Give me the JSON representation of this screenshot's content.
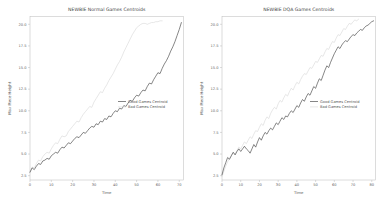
{
  "figure": {
    "background": "#ffffff",
    "width": 383,
    "height": 207
  },
  "chart_data": [
    {
      "type": "line",
      "panel": "left",
      "title": "NEWBIE Normal Games Centroids",
      "xlabel": "Time",
      "ylabel": "Max Piece Height",
      "xlim": [
        0,
        72
      ],
      "ylim": [
        2.0,
        20.9
      ],
      "xticks": [
        0,
        10,
        20,
        30,
        40,
        50,
        60,
        70
      ],
      "yticks": [
        2.5,
        5.0,
        7.5,
        10.0,
        12.5,
        15.0,
        17.5,
        20.0
      ],
      "grid": false,
      "legend_position": "center-right",
      "series": [
        {
          "name": "Good Games Centroid",
          "color": "#3a3a3a",
          "x": [
            0,
            1,
            2,
            3,
            4,
            5,
            6,
            7,
            8,
            9,
            10,
            11,
            12,
            13,
            14,
            15,
            16,
            17,
            18,
            19,
            20,
            21,
            22,
            23,
            24,
            25,
            26,
            27,
            28,
            29,
            30,
            31,
            32,
            33,
            34,
            35,
            36,
            37,
            38,
            39,
            40,
            41,
            42,
            43,
            44,
            45,
            46,
            47,
            48,
            49,
            50,
            51,
            52,
            53,
            54,
            55,
            56,
            57,
            58,
            59,
            60,
            61,
            62,
            63,
            64,
            65,
            66,
            67,
            68,
            69,
            70,
            71
          ],
          "y": [
            2.9,
            3.4,
            3.2,
            3.6,
            3.9,
            3.8,
            4.2,
            4.3,
            4.5,
            4.4,
            4.8,
            5.0,
            5.2,
            5.1,
            5.5,
            5.8,
            5.7,
            6.0,
            6.3,
            6.2,
            6.5,
            6.8,
            7.0,
            6.9,
            7.2,
            7.5,
            7.4,
            7.7,
            8.0,
            8.2,
            8.1,
            8.5,
            8.4,
            8.8,
            8.7,
            9.1,
            9.0,
            9.4,
            9.3,
            9.7,
            10.0,
            9.9,
            10.3,
            10.2,
            10.6,
            10.5,
            10.9,
            11.2,
            11.1,
            11.5,
            11.8,
            11.7,
            12.1,
            12.4,
            12.3,
            12.8,
            13.2,
            13.1,
            13.6,
            14.0,
            14.4,
            14.3,
            14.9,
            15.4,
            15.8,
            16.3,
            16.9,
            17.4,
            18.0,
            18.7,
            19.4,
            20.2
          ]
        },
        {
          "name": "Bad Games Centroid",
          "color": "#d8d8d8",
          "x": [
            0,
            1,
            2,
            3,
            4,
            5,
            6,
            7,
            8,
            9,
            10,
            11,
            12,
            13,
            14,
            15,
            16,
            17,
            18,
            19,
            20,
            21,
            22,
            23,
            24,
            25,
            26,
            27,
            28,
            29,
            30,
            31,
            32,
            33,
            34,
            35,
            36,
            37,
            38,
            39,
            40,
            41,
            42,
            43,
            44,
            45,
            46,
            47,
            48,
            49,
            50,
            51,
            52,
            53,
            54,
            55,
            56,
            57,
            58,
            59,
            60,
            61,
            62
          ],
          "y": [
            2.9,
            3.5,
            3.4,
            3.9,
            4.3,
            4.2,
            4.7,
            5.0,
            5.2,
            5.1,
            5.6,
            6.0,
            6.3,
            6.2,
            6.7,
            7.1,
            7.0,
            7.1,
            7.6,
            7.9,
            8.2,
            8.5,
            8.8,
            8.7,
            9.2,
            9.6,
            9.9,
            10.2,
            10.5,
            10.4,
            11.0,
            11.4,
            11.8,
            12.2,
            12.1,
            12.6,
            13.0,
            13.5,
            13.9,
            14.3,
            14.8,
            15.3,
            15.7,
            16.2,
            16.8,
            17.3,
            17.8,
            18.3,
            18.8,
            19.2,
            19.6,
            19.8,
            20.0,
            20.1,
            20.1,
            20.0,
            20.1,
            20.2,
            20.2,
            20.3,
            20.3,
            20.4,
            20.4
          ]
        }
      ]
    },
    {
      "type": "line",
      "panel": "right",
      "title": "NEWBIE DQA Games Centroids",
      "xlabel": "Time",
      "ylabel": "Max Piece Height",
      "xlim": [
        0,
        82
      ],
      "ylim": [
        2.0,
        20.9
      ],
      "xticks": [
        0,
        10,
        20,
        30,
        40,
        50,
        60,
        70,
        80
      ],
      "yticks": [
        2.5,
        5.0,
        7.5,
        10.0,
        12.5,
        15.0,
        17.5,
        20.0
      ],
      "grid": false,
      "legend_position": "center-right",
      "series": [
        {
          "name": "Good Games Centroid",
          "color": "#3a3a3a",
          "x": [
            0,
            1,
            2,
            3,
            4,
            5,
            6,
            7,
            8,
            9,
            10,
            11,
            12,
            13,
            14,
            15,
            16,
            17,
            18,
            19,
            20,
            21,
            22,
            23,
            24,
            25,
            26,
            27,
            28,
            29,
            30,
            31,
            32,
            33,
            34,
            35,
            36,
            37,
            38,
            39,
            40,
            41,
            42,
            43,
            44,
            45,
            46,
            47,
            48,
            49,
            50,
            51,
            52,
            53,
            54,
            55,
            56,
            57,
            58,
            59,
            60,
            61,
            62,
            63,
            64,
            65,
            66,
            67,
            68,
            69,
            70,
            71,
            72,
            73,
            74,
            75,
            76,
            77,
            78,
            79,
            80,
            81
          ],
          "y": [
            2.6,
            3.4,
            4.0,
            4.6,
            4.4,
            4.8,
            5.2,
            4.9,
            5.3,
            5.6,
            5.3,
            5.6,
            5.9,
            5.6,
            5.4,
            5.1,
            5.6,
            6.1,
            5.8,
            6.4,
            6.9,
            6.6,
            7.1,
            7.5,
            7.3,
            7.7,
            8.0,
            7.8,
            8.2,
            8.6,
            8.4,
            8.8,
            9.2,
            9.0,
            9.4,
            9.3,
            9.7,
            10.0,
            9.8,
            10.2,
            10.6,
            10.4,
            10.9,
            11.3,
            11.1,
            11.6,
            12.0,
            11.8,
            12.3,
            12.8,
            12.6,
            13.2,
            13.7,
            13.5,
            14.1,
            14.7,
            15.2,
            15.0,
            15.6,
            16.1,
            16.6,
            17.0,
            17.4,
            17.2,
            17.6,
            17.9,
            18.1,
            18.0,
            18.3,
            18.6,
            18.8,
            18.7,
            19.0,
            19.2,
            19.4,
            19.3,
            19.6,
            19.8,
            19.9,
            20.1,
            20.3,
            20.4
          ]
        },
        {
          "name": "Bad Games Centroid",
          "color": "#d8d8d8",
          "x": [
            0,
            1,
            2,
            3,
            4,
            5,
            6,
            7,
            8,
            9,
            10,
            11,
            12,
            13,
            14,
            15,
            16,
            17,
            18,
            19,
            20,
            21,
            22,
            23,
            24,
            25,
            26,
            27,
            28,
            29,
            30,
            31,
            32,
            33,
            34,
            35,
            36,
            37,
            38,
            39,
            40,
            41,
            42,
            43,
            44,
            45,
            46,
            47,
            48,
            49,
            50,
            51,
            52,
            53,
            54,
            55,
            56,
            57,
            58,
            59,
            60,
            61,
            62,
            63,
            64,
            65,
            66,
            67,
            68,
            69,
            70,
            71,
            72,
            73
          ],
          "y": [
            2.4,
            3.0,
            3.6,
            4.1,
            4.5,
            4.9,
            5.2,
            5.0,
            5.4,
            5.8,
            5.6,
            6.0,
            6.4,
            6.2,
            6.6,
            7.0,
            6.8,
            7.3,
            7.7,
            7.6,
            8.1,
            8.5,
            8.3,
            8.9,
            9.3,
            9.1,
            9.7,
            10.1,
            10.4,
            10.2,
            10.8,
            11.2,
            11.0,
            11.5,
            11.9,
            11.7,
            12.2,
            12.6,
            12.4,
            12.9,
            13.3,
            13.1,
            13.6,
            14.0,
            14.3,
            14.2,
            14.6,
            15.0,
            14.9,
            15.3,
            15.7,
            15.6,
            16.0,
            16.4,
            16.3,
            16.8,
            17.2,
            17.1,
            17.6,
            18.0,
            17.9,
            18.4,
            18.8,
            18.7,
            19.1,
            19.5,
            19.4,
            19.8,
            20.1,
            20.0,
            20.3,
            20.5,
            20.4,
            20.6
          ]
        }
      ]
    }
  ]
}
